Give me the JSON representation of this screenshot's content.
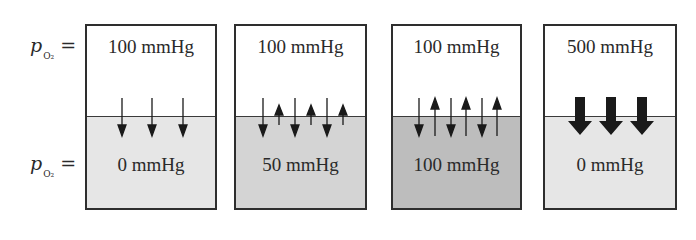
{
  "row_labels": [
    {
      "symbol": "p",
      "subscript": "O₂",
      "equals": "="
    },
    {
      "symbol": "p",
      "subscript": "O₂",
      "equals": "="
    }
  ],
  "panels": [
    {
      "top": "100 mmHg",
      "bottom": "0 mmHg",
      "lower_fill": "#e6e6e6",
      "arrows": "3 thin arrows downward (net diffusion into lower compartment)"
    },
    {
      "top": "100 mmHg",
      "bottom": "50 mmHg",
      "lower_fill": "#d4d4d4",
      "arrows": "3 long downward arrows alternating with 3 short upward arrows"
    },
    {
      "top": "100 mmHg",
      "bottom": "100 mmHg",
      "lower_fill": "#bdbdbd",
      "arrows": "3 downward and 3 upward arrows of equal length (equilibrium)"
    },
    {
      "top": "500 mmHg",
      "bottom": "0 mmHg",
      "lower_fill": "#e6e6e6",
      "arrows": "3 thick bold downward arrows"
    }
  ],
  "colors": {
    "border": "#2e2e2e",
    "text": "#2a2a2a",
    "arrow": "#1a1a1a"
  }
}
